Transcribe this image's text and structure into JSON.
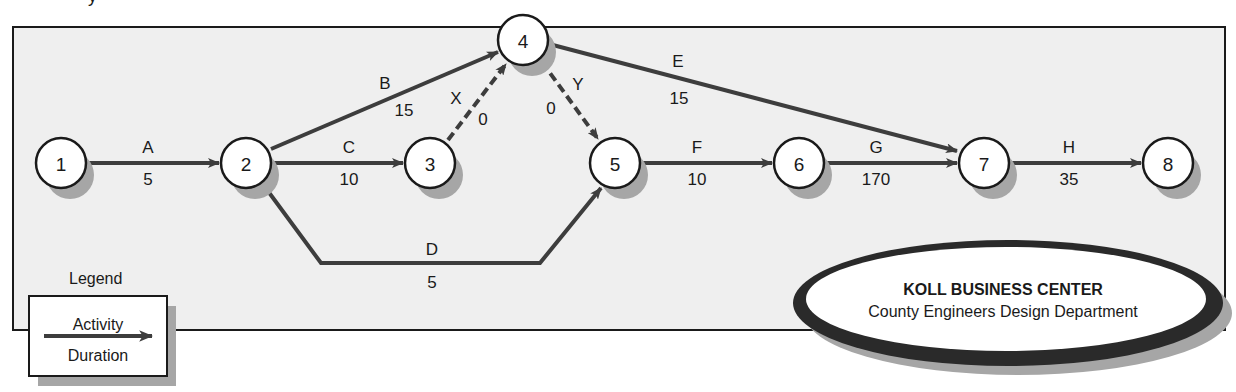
{
  "diagram": {
    "type": "activity-on-arrow network",
    "cropped_top_glyph": "y",
    "colors": {
      "frame_fill": "#efefef",
      "frame_border": "#1a1a1a",
      "arrow": "#3d3d3d",
      "node_fill": "#ffffff",
      "node_shadow": "#a6a6a6",
      "oval_ring": "#2a2a2a"
    },
    "nodes": [
      {
        "id": "1",
        "label": "1",
        "x": 61,
        "y": 163
      },
      {
        "id": "2",
        "label": "2",
        "x": 246,
        "y": 163
      },
      {
        "id": "3",
        "label": "3",
        "x": 430,
        "y": 163
      },
      {
        "id": "4",
        "label": "4",
        "x": 523,
        "y": 40
      },
      {
        "id": "5",
        "label": "5",
        "x": 615,
        "y": 163
      },
      {
        "id": "6",
        "label": "6",
        "x": 799,
        "y": 163
      },
      {
        "id": "7",
        "label": "7",
        "x": 984,
        "y": 163
      },
      {
        "id": "8",
        "label": "8",
        "x": 1168,
        "y": 163
      }
    ],
    "activities": [
      {
        "activity": "A",
        "duration": "5",
        "from": "1",
        "to": "2",
        "dummy": false
      },
      {
        "activity": "B",
        "duration": "15",
        "from": "2",
        "to": "4",
        "dummy": false
      },
      {
        "activity": "C",
        "duration": "10",
        "from": "2",
        "to": "3",
        "dummy": false
      },
      {
        "activity": "D",
        "duration": "5",
        "from": "2",
        "to": "5",
        "dummy": false
      },
      {
        "activity": "X",
        "duration": "0",
        "from": "3",
        "to": "4",
        "dummy": true
      },
      {
        "activity": "Y",
        "duration": "0",
        "from": "4",
        "to": "5",
        "dummy": true
      },
      {
        "activity": "E",
        "duration": "15",
        "from": "4",
        "to": "7",
        "dummy": false
      },
      {
        "activity": "F",
        "duration": "10",
        "from": "5",
        "to": "6",
        "dummy": false
      },
      {
        "activity": "G",
        "duration": "170",
        "from": "6",
        "to": "7",
        "dummy": false
      },
      {
        "activity": "H",
        "duration": "35",
        "from": "7",
        "to": "8",
        "dummy": false
      }
    ],
    "legend": {
      "title": "Legend",
      "top_label": "Activity",
      "bottom_label": "Duration"
    },
    "org_badge": {
      "title": "KOLL BUSINESS CENTER",
      "subtitle": "County Engineers Design Department"
    }
  }
}
